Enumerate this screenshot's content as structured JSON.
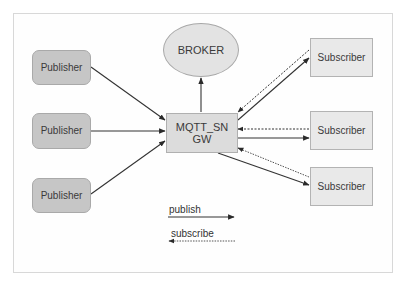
{
  "diagram": {
    "broker": {
      "label": "BROKER"
    },
    "gateway": {
      "label_line1": "MQTT_SN",
      "label_line2": "GW"
    },
    "publishers": [
      {
        "label": "Publisher"
      },
      {
        "label": "Publisher"
      },
      {
        "label": "Publisher"
      }
    ],
    "subscribers": [
      {
        "label": "Subscriber"
      },
      {
        "label": "Subscriber"
      },
      {
        "label": "Subscriber"
      }
    ],
    "legend": {
      "publish": "publish",
      "subscribe": "subscribe"
    },
    "edges": [
      {
        "from": "Publisher 1",
        "to": "MQTT_SN GW",
        "type": "publish"
      },
      {
        "from": "Publisher 2",
        "to": "MQTT_SN GW",
        "type": "publish"
      },
      {
        "from": "Publisher 3",
        "to": "MQTT_SN GW",
        "type": "publish"
      },
      {
        "from": "MQTT_SN GW",
        "to": "BROKER",
        "type": "publish"
      },
      {
        "from": "MQTT_SN GW",
        "to": "Subscriber 1",
        "type": "publish"
      },
      {
        "from": "Subscriber 1",
        "to": "MQTT_SN GW",
        "type": "subscribe"
      },
      {
        "from": "MQTT_SN GW",
        "to": "Subscriber 2",
        "type": "publish"
      },
      {
        "from": "Subscriber 2",
        "to": "MQTT_SN GW",
        "type": "subscribe"
      },
      {
        "from": "MQTT_SN GW",
        "to": "Subscriber 3",
        "type": "publish"
      },
      {
        "from": "Subscriber 3",
        "to": "MQTT_SN GW",
        "type": "subscribe"
      }
    ],
    "colors": {
      "publisher_fill": "#c6c6c6",
      "subscriber_fill": "#e9e9e9",
      "gateway_fill": "#dcdcdc",
      "broker_fill": "#e3e3e3",
      "line": "#333333"
    }
  }
}
